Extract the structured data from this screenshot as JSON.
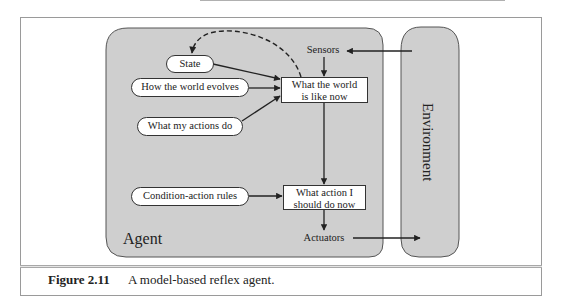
{
  "diagram": {
    "agent": {
      "label": "Agent",
      "sensors": "Sensors",
      "actuators": "Actuators",
      "state": "State",
      "world_evolves": "How the world evolves",
      "actions_do": "What my actions do",
      "rules": "Condition-action rules",
      "world_now": "What the world is like now",
      "world_now_line1": "What the world",
      "world_now_line2": "is like now",
      "action_now": "What action I should do now",
      "action_now_line1": "What action I",
      "action_now_line2": "should do now"
    },
    "environment": {
      "label": "Environment"
    },
    "colors": {
      "agent_fill": "#cfcfcf",
      "environment_fill": "#cfcfcf",
      "box_fill": "#ffffff",
      "stroke": "#222222"
    },
    "edges": [
      {
        "from": "Environment",
        "to": "Sensors"
      },
      {
        "from": "Sensors",
        "to": "What the world is like now"
      },
      {
        "from": "State",
        "to": "What the world is like now"
      },
      {
        "from": "How the world evolves",
        "to": "What the world is like now"
      },
      {
        "from": "What my actions do",
        "to": "What the world is like now"
      },
      {
        "from": "What the world is like now",
        "to": "State",
        "style": "dashed"
      },
      {
        "from": "What the world is like now",
        "to": "What action I should do now"
      },
      {
        "from": "Condition-action rules",
        "to": "What action I should do now"
      },
      {
        "from": "What action I should do now",
        "to": "Actuators"
      },
      {
        "from": "Actuators",
        "to": "Environment"
      }
    ]
  },
  "caption": {
    "figure_number": "Figure 2.11",
    "text": "A model-based reflex agent."
  }
}
